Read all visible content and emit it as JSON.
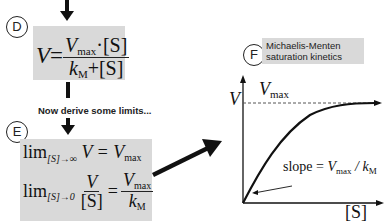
{
  "labels": {
    "d": "D",
    "e": "E",
    "f": "F"
  },
  "equation_d": {
    "lhs": "V",
    "equals": "=",
    "num_main": "V",
    "num_sub": "max",
    "num_rest": "·[S]",
    "den_main": "k",
    "den_sub": "M",
    "den_rest": "+[S]"
  },
  "note": "Now derive some limits...",
  "equation_e1": {
    "lim": "lim",
    "cond": "[S]→∞",
    "expr": "V = V",
    "expr_sub": "max"
  },
  "equation_e2": {
    "lim": "lim",
    "cond": "[S]→0",
    "num": "V",
    "den": "[S]",
    "equals": "=",
    "rnum_main": "V",
    "rnum_sub": "max",
    "rden_main": "k",
    "rden_sub": "M"
  },
  "panel_f": {
    "title_line1": "Michaelis-Menten",
    "title_line2": "saturation kinetics"
  },
  "graph": {
    "y_label": "V",
    "vmax_main": "V",
    "vmax_sub": "max",
    "x_label": "[S]",
    "slope_text": "slope = ",
    "slope_v": "V",
    "slope_vsub": "max",
    "slope_div": " / ",
    "slope_k": "k",
    "slope_ksub": "M"
  },
  "colors": {
    "box_gray": "#d9d9d9",
    "ink": "#111111"
  }
}
